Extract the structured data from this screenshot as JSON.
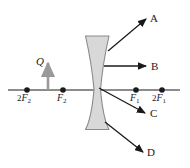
{
  "figure": {
    "colors": {
      "line": "#1a1a1a",
      "lens_fill": "#d8d8d8",
      "lens_stroke": "#8a8a8a",
      "object_arrow": "#9a9a9a",
      "background": "#ffffff"
    },
    "axis": {
      "name": "principal-axis",
      "y": 90,
      "x_start": 8,
      "x_end": 180
    },
    "lens": {
      "type": "diverging-biconcave",
      "center_x": 97,
      "top_y": 35,
      "bottom_y": 130
    },
    "object": {
      "label": "Q",
      "x": 48,
      "tip_y": 62,
      "base_y": 90
    },
    "focal_points": [
      {
        "id": "two-f2",
        "label_main": "2",
        "label_italic": "F",
        "label_sub": "2",
        "x": 27,
        "label_x": 17,
        "label_y": 93
      },
      {
        "id": "f2",
        "label_main": "",
        "label_italic": "F",
        "label_sub": "2",
        "x": 63,
        "label_x": 57,
        "label_y": 93
      },
      {
        "id": "f1",
        "label_main": "",
        "label_italic": "F",
        "label_sub": "1",
        "x": 136,
        "label_x": 130,
        "label_y": 93
      },
      {
        "id": "two-f1",
        "label_main": "2",
        "label_italic": "F",
        "label_sub": "1",
        "x": 162,
        "label_x": 152,
        "label_y": 93
      }
    ],
    "rays": [
      {
        "id": "ray-a",
        "label": "A",
        "x1": 108,
        "y1": 51,
        "x2": 146,
        "y2": 19,
        "label_x": 150,
        "label_y": 13
      },
      {
        "id": "ray-b",
        "label": "B",
        "x1": 104,
        "y1": 66,
        "x2": 146,
        "y2": 66,
        "label_x": 151,
        "label_y": 61
      },
      {
        "id": "ray-c",
        "label": "C",
        "x1": 99,
        "y1": 88,
        "x2": 145,
        "y2": 113,
        "label_x": 150,
        "label_y": 108
      },
      {
        "id": "ray-d",
        "label": "D",
        "x1": 105,
        "y1": 122,
        "x2": 143,
        "y2": 152,
        "label_x": 147,
        "label_y": 147
      }
    ]
  }
}
